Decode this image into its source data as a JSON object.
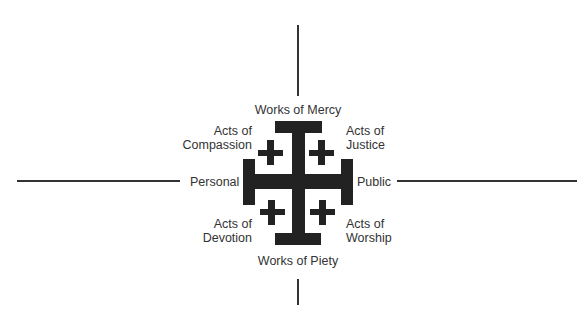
{
  "diagram": {
    "type": "quadrant-cross",
    "center_symbol": "jerusalem-cross",
    "colors": {
      "cross": "#222222",
      "text": "#333333",
      "axis_lines": "#333333",
      "background": "#ffffff"
    },
    "axes": {
      "top": "Works of Mercy",
      "bottom": "Works of Piety",
      "left": "Personal",
      "right": "Public"
    },
    "quadrants": {
      "top_left": {
        "line1": "Acts of",
        "line2": "Compassion"
      },
      "top_right": {
        "line1": "Acts of",
        "line2": "Justice"
      },
      "bottom_left": {
        "line1": "Acts of",
        "line2": "Devotion"
      },
      "bottom_right": {
        "line1": "Acts of",
        "line2": "Worship"
      }
    }
  }
}
